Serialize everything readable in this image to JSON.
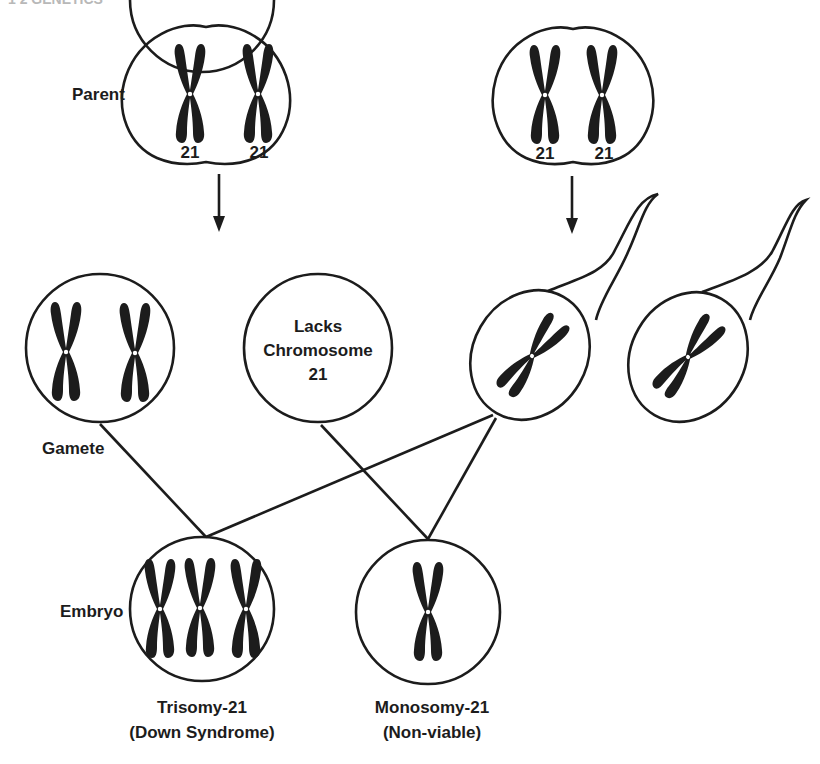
{
  "header": {
    "clipped_running_head": "1 2  GENETICS"
  },
  "labels": {
    "parent": "Parent",
    "gamete": "Gamete",
    "embryo": "Embryo",
    "chromosome_number": "21",
    "lacks_line1": "Lacks",
    "lacks_line2": "Chromosome",
    "lacks_line3": "21"
  },
  "outcomes": {
    "trisomy": {
      "line1": "Trisomy-21",
      "line2": "(Down Syndrome)"
    },
    "monosomy": {
      "line1": "Monosomy-21",
      "line2": "(Non-viable)"
    }
  },
  "colors": {
    "ink": "#1c1c1c",
    "background": "#ffffff"
  }
}
